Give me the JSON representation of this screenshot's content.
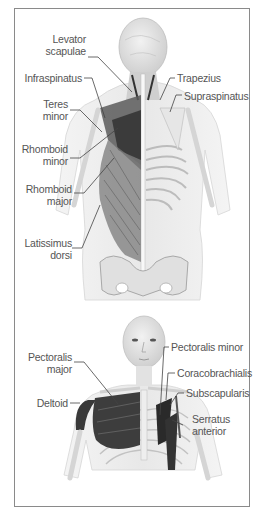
{
  "figures": [
    {
      "view": "posterior",
      "labels": [
        {
          "id": "levator-scapulae",
          "lines": [
            "Levator",
            "scapulae"
          ]
        },
        {
          "id": "infraspinatus",
          "lines": [
            "Infraspinatus"
          ]
        },
        {
          "id": "teres-minor",
          "lines": [
            "Teres",
            "minor"
          ]
        },
        {
          "id": "rhomboid-minor",
          "lines": [
            "Rhomboid",
            "minor"
          ]
        },
        {
          "id": "rhomboid-major",
          "lines": [
            "Rhomboid",
            "major"
          ]
        },
        {
          "id": "latissimus-dorsi",
          "lines": [
            "Latissimus",
            "dorsi"
          ]
        },
        {
          "id": "trapezius",
          "lines": [
            "Trapezius"
          ]
        },
        {
          "id": "supraspinatus",
          "lines": [
            "Supraspinatus"
          ]
        }
      ]
    },
    {
      "view": "anterior",
      "labels": [
        {
          "id": "pectoralis-major",
          "lines": [
            "Pectoralis",
            "major"
          ]
        },
        {
          "id": "deltoid",
          "lines": [
            "Deltoid"
          ]
        },
        {
          "id": "pectoralis-minor",
          "lines": [
            "Pectoralis minor"
          ]
        },
        {
          "id": "coracobrachialis",
          "lines": [
            "Coracobrachialis"
          ]
        },
        {
          "id": "subscapularis",
          "lines": [
            "Subscapularis"
          ]
        },
        {
          "id": "serratus-anterior",
          "lines": [
            "Serratus",
            "anterior"
          ]
        }
      ]
    }
  ],
  "colors": {
    "muscle_dark": "#2e2e2e",
    "muscle_mid": "#6a6a6a",
    "bone": "#e2e2e2",
    "skin": "#efefef",
    "leader": "#444444",
    "frame": "#8a8a8a"
  }
}
